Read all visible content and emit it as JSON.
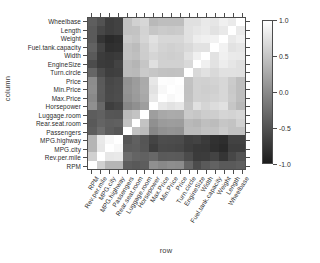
{
  "chart_data": {
    "type": "heatmap",
    "title": "",
    "xlabel": "row",
    "ylabel": "column",
    "grid": false,
    "legend_position": "right",
    "colorbar": {
      "ticks": [
        "1.0",
        "0.5",
        "0.0",
        "-0.5",
        "-1.0"
      ],
      "tick_values": [
        1.0,
        0.5,
        0.0,
        -0.5,
        -1.0
      ],
      "vmin": -1.0,
      "vmax": 1.0,
      "low_color": "#1c1c1c",
      "high_color": "#ffffff"
    },
    "x_categories": [
      "RPM",
      "Rev.per.mile",
      "MPG.city",
      "MPG.highway",
      "Passengers",
      "Rear.seat.room",
      "Luggage.room",
      "Horsepower",
      "Max.Price",
      "Min.Price",
      "Price",
      "Turn.circle",
      "EngineSize",
      "Width",
      "Fuel.tank.capacity",
      "Weight",
      "Length",
      "Wheelbase"
    ],
    "y_categories": [
      "Wheelbase",
      "Length",
      "Weight",
      "Fuel.tank.capacity",
      "Width",
      "EngineSize",
      "Turn.circle",
      "Price",
      "Min.Price",
      "Max.Price",
      "Horsepower",
      "Luggage.room",
      "Rear.seat.room",
      "Passengers",
      "MPG.highway",
      "MPG.city",
      "Rev.per.mile",
      "RPM"
    ],
    "values": [
      [
        -0.39,
        -0.5,
        -0.67,
        -0.64,
        0.47,
        0.6,
        0.65,
        0.39,
        0.44,
        0.44,
        0.44,
        0.73,
        0.73,
        0.81,
        0.78,
        0.87,
        0.82,
        1.0
      ],
      [
        -0.43,
        -0.59,
        -0.67,
        -0.64,
        0.47,
        0.48,
        0.62,
        0.51,
        0.55,
        0.53,
        0.55,
        0.74,
        0.78,
        0.82,
        0.75,
        0.81,
        1.0,
        0.82
      ],
      [
        -0.43,
        -0.75,
        -0.84,
        -0.81,
        0.55,
        0.51,
        0.64,
        0.74,
        0.65,
        0.65,
        0.65,
        0.74,
        0.84,
        0.87,
        0.89,
        1.0,
        0.81,
        0.87
      ],
      [
        -0.36,
        -0.63,
        -0.8,
        -0.78,
        0.47,
        0.42,
        0.58,
        0.7,
        0.62,
        0.59,
        0.62,
        0.67,
        0.75,
        0.75,
        1.0,
        0.89,
        0.75,
        0.78
      ],
      [
        -0.43,
        -0.69,
        -0.72,
        -0.7,
        0.48,
        0.45,
        0.57,
        0.64,
        0.59,
        0.58,
        0.59,
        0.74,
        0.87,
        1.0,
        0.75,
        0.87,
        0.82,
        0.81
      ],
      [
        -0.55,
        -0.7,
        -0.71,
        -0.63,
        0.41,
        0.36,
        0.51,
        0.73,
        0.6,
        0.6,
        0.6,
        0.67,
        1.0,
        0.87,
        0.75,
        0.84,
        0.78,
        0.73
      ],
      [
        -0.33,
        -0.56,
        -0.67,
        -0.65,
        0.41,
        0.39,
        0.54,
        0.51,
        0.47,
        0.46,
        0.47,
        1.0,
        0.67,
        0.74,
        0.67,
        0.74,
        0.74,
        0.73
      ],
      [
        -0.0,
        -0.43,
        -0.59,
        -0.56,
        0.06,
        0.14,
        0.26,
        0.79,
        0.98,
        0.97,
        1.0,
        0.47,
        0.6,
        0.59,
        0.62,
        0.65,
        0.55,
        0.44
      ],
      [
        0.02,
        -0.42,
        -0.58,
        -0.55,
        0.07,
        0.15,
        0.27,
        0.75,
        0.94,
        1.0,
        0.97,
        0.46,
        0.6,
        0.58,
        0.59,
        0.65,
        0.53,
        0.44
      ],
      [
        -0.02,
        -0.43,
        -0.57,
        -0.54,
        0.05,
        0.13,
        0.25,
        0.8,
        1.0,
        0.94,
        0.98,
        0.47,
        0.6,
        0.59,
        0.62,
        0.65,
        0.55,
        0.44
      ],
      [
        0.04,
        -0.31,
        -0.67,
        -0.62,
        -0.04,
        0.04,
        0.16,
        1.0,
        0.8,
        0.75,
        0.79,
        0.51,
        0.73,
        0.64,
        0.7,
        0.74,
        0.51,
        0.39
      ],
      [
        -0.4,
        -0.37,
        -0.46,
        -0.47,
        0.41,
        0.48,
        1.0,
        0.16,
        0.25,
        0.27,
        0.26,
        0.54,
        0.51,
        0.57,
        0.58,
        0.64,
        0.62,
        0.65
      ],
      [
        -0.44,
        -0.34,
        -0.39,
        -0.38,
        0.47,
        1.0,
        0.48,
        0.04,
        0.13,
        0.15,
        0.14,
        0.39,
        0.36,
        0.45,
        0.42,
        0.51,
        0.48,
        0.6
      ],
      [
        -0.4,
        -0.26,
        -0.41,
        -0.46,
        1.0,
        0.47,
        0.41,
        -0.04,
        0.05,
        0.07,
        0.06,
        0.41,
        0.41,
        0.48,
        0.47,
        0.55,
        0.47,
        0.47
      ],
      [
        0.36,
        0.81,
        0.94,
        1.0,
        -0.46,
        -0.38,
        -0.47,
        -0.62,
        -0.54,
        -0.55,
        -0.56,
        -0.65,
        -0.63,
        -0.7,
        -0.78,
        -0.81,
        -0.64,
        -0.64
      ],
      [
        0.36,
        0.79,
        1.0,
        0.94,
        -0.41,
        -0.39,
        -0.46,
        -0.67,
        -0.57,
        -0.58,
        -0.59,
        -0.67,
        -0.71,
        -0.72,
        -0.8,
        -0.84,
        -0.67,
        -0.67
      ],
      [
        0.59,
        1.0,
        0.79,
        0.81,
        -0.26,
        -0.34,
        -0.37,
        -0.31,
        -0.43,
        -0.42,
        -0.43,
        -0.56,
        -0.7,
        -0.69,
        -0.63,
        -0.75,
        -0.59,
        -0.5
      ],
      [
        1.0,
        0.59,
        0.36,
        0.36,
        -0.4,
        -0.44,
        -0.4,
        0.04,
        -0.02,
        0.02,
        -0.0,
        -0.33,
        -0.55,
        -0.43,
        -0.36,
        -0.43,
        -0.43,
        -0.39
      ]
    ]
  }
}
